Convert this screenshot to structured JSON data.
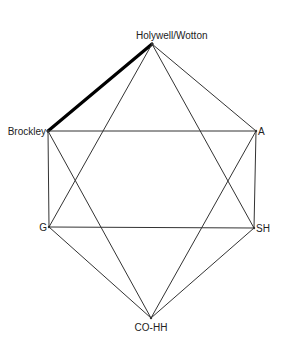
{
  "diagram": {
    "type": "network-graph",
    "nodes": [
      {
        "id": "holywell",
        "label": "Holywell/Wotton",
        "x": 152,
        "y": 44,
        "label_x": 136,
        "label_y": 39,
        "anchor": "start"
      },
      {
        "id": "brockley",
        "label": "Brockley",
        "x": 48,
        "y": 131,
        "label_x": 46,
        "label_y": 135,
        "anchor": "end"
      },
      {
        "id": "a",
        "label": "A",
        "x": 256,
        "y": 131,
        "label_x": 258,
        "label_y": 135,
        "anchor": "start"
      },
      {
        "id": "g",
        "label": "G",
        "x": 49,
        "y": 227,
        "label_x": 47,
        "label_y": 231,
        "anchor": "end"
      },
      {
        "id": "sh",
        "label": "SH",
        "x": 254,
        "y": 228,
        "label_x": 256,
        "label_y": 232,
        "anchor": "start"
      },
      {
        "id": "cohh",
        "label": "CO-HH",
        "x": 151,
        "y": 318,
        "label_x": 151,
        "label_y": 331,
        "anchor": "middle"
      }
    ],
    "edges": [
      {
        "from": "holywell",
        "to": "brockley",
        "weight": "thick"
      },
      {
        "from": "holywell",
        "to": "a",
        "weight": "thin"
      },
      {
        "from": "holywell",
        "to": "g",
        "weight": "thin"
      },
      {
        "from": "holywell",
        "to": "sh",
        "weight": "thin"
      },
      {
        "from": "brockley",
        "to": "a",
        "weight": "thin"
      },
      {
        "from": "brockley",
        "to": "g",
        "weight": "thin"
      },
      {
        "from": "brockley",
        "to": "cohh",
        "weight": "thin"
      },
      {
        "from": "a",
        "to": "sh",
        "weight": "thin"
      },
      {
        "from": "a",
        "to": "cohh",
        "weight": "thin"
      },
      {
        "from": "g",
        "to": "sh",
        "weight": "thin"
      },
      {
        "from": "g",
        "to": "cohh",
        "weight": "thin"
      },
      {
        "from": "sh",
        "to": "cohh",
        "weight": "thin"
      }
    ],
    "colors": {
      "edge": "#333333",
      "highlight_edge": "#000000",
      "label": "#222222",
      "background": "#ffffff"
    }
  }
}
